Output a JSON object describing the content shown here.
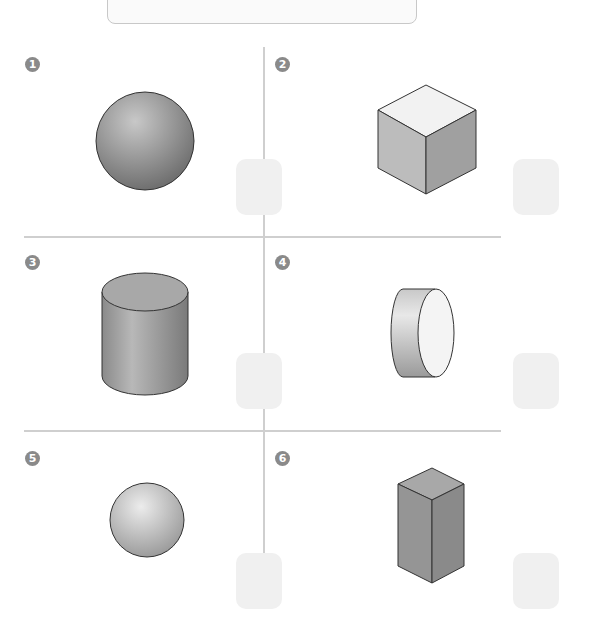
{
  "items": [
    {
      "number": "1",
      "shape": "sphere"
    },
    {
      "number": "2",
      "shape": "cube"
    },
    {
      "number": "3",
      "shape": "cylinder-upright"
    },
    {
      "number": "4",
      "shape": "cylinder-lying"
    },
    {
      "number": "5",
      "shape": "sphere-small"
    },
    {
      "number": "6",
      "shape": "rectangular-prism"
    }
  ],
  "colors": {
    "badge": "#8a8a8a",
    "divider": "#cfcfcf",
    "answer_box": "#f0f0f0",
    "shape_stroke": "#333333"
  }
}
